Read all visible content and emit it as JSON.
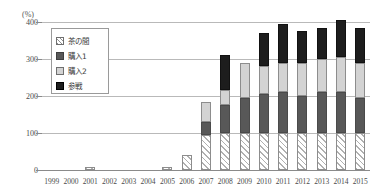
{
  "chart_data": {
    "type": "bar",
    "stacked": true,
    "title": "",
    "subtitle": "",
    "xlabel": "",
    "ylabel": "(%)",
    "unit_label": "(%)",
    "ylim": [
      0,
      400
    ],
    "yticks": [
      0,
      100,
      200,
      300,
      400
    ],
    "ytick_labels": [
      "0",
      "100",
      "200",
      "300",
      "400"
    ],
    "grid": true,
    "legend_position": "inside-top-left",
    "categories": [
      "1999",
      "2000",
      "2001",
      "2002",
      "2003",
      "2004",
      "2005",
      "2006",
      "2007",
      "2008",
      "2009",
      "2010",
      "2011",
      "2012",
      "2013",
      "2014",
      "2015"
    ],
    "series": [
      {
        "name": "茶の間",
        "key": "chanoma",
        "color": "#ffffff",
        "pattern": "diagonal-hatch",
        "values": [
          0,
          0,
          8,
          0,
          0,
          0,
          8,
          40,
          95,
          100,
          100,
          100,
          100,
          100,
          100,
          100,
          100
        ]
      },
      {
        "name": "購入1",
        "key": "kounyu1",
        "color": "#585858",
        "pattern": "solid",
        "values": [
          0,
          0,
          0,
          0,
          0,
          0,
          0,
          0,
          35,
          75,
          95,
          105,
          110,
          100,
          110,
          110,
          95
        ]
      },
      {
        "name": "購入2",
        "key": "kounyu2",
        "color": "#d3d3d3",
        "pattern": "solid",
        "values": [
          0,
          0,
          0,
          0,
          0,
          0,
          0,
          0,
          55,
          40,
          95,
          75,
          80,
          90,
          90,
          95,
          95
        ]
      },
      {
        "name": "参戦",
        "key": "sansen",
        "color": "#1d1d1d",
        "pattern": "solid",
        "values": [
          0,
          0,
          0,
          0,
          0,
          0,
          0,
          0,
          0,
          95,
          0,
          90,
          105,
          85,
          85,
          100,
          95
        ]
      }
    ],
    "totals": [
      0,
      0,
      8,
      0,
      0,
      0,
      8,
      40,
      185,
      310,
      290,
      370,
      395,
      375,
      385,
      405,
      385
    ]
  },
  "legend": {
    "items": [
      {
        "label": "茶の間",
        "swatch": "hatched-swatch"
      },
      {
        "label": "購入1",
        "swatch": "dark-gray-swatch"
      },
      {
        "label": "購入2",
        "swatch": "light-gray-swatch"
      },
      {
        "label": "参戦",
        "swatch": "black-swatch"
      }
    ]
  }
}
